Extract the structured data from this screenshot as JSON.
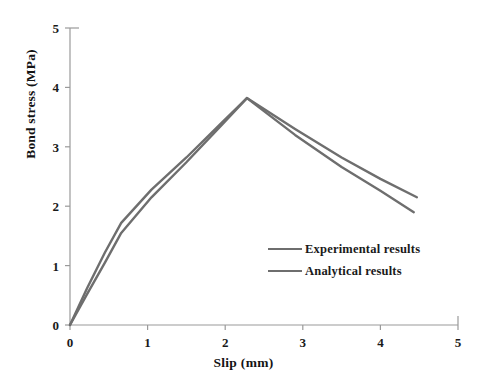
{
  "chart_data": {
    "type": "line",
    "title": "",
    "xlabel": "Slip  (mm)",
    "ylabel": "Bond stress (MPa)",
    "xlim": [
      0,
      5
    ],
    "ylim": [
      0,
      5
    ],
    "xticks": [
      "0",
      "1",
      "2",
      "3",
      "4",
      "5"
    ],
    "yticks": [
      "0",
      "1",
      "2",
      "3",
      "4",
      "5"
    ],
    "grid": false,
    "legend_position": "center-right",
    "series": [
      {
        "name": "Experimental results",
        "color": "#6e6e6e",
        "x": [
          0.0,
          0.22,
          0.45,
          0.66,
          1.05,
          1.5,
          1.95,
          2.28,
          2.9,
          3.5,
          4.0,
          4.47
        ],
        "y": [
          0.0,
          0.62,
          1.22,
          1.72,
          2.28,
          2.82,
          3.4,
          3.82,
          3.3,
          2.82,
          2.46,
          2.15
        ]
      },
      {
        "name": "Analytical results",
        "color": "#6e6e6e",
        "x": [
          0.0,
          0.22,
          0.45,
          0.66,
          1.05,
          1.5,
          1.95,
          2.28,
          2.9,
          3.5,
          4.0,
          4.43
        ],
        "y": [
          0.0,
          0.52,
          1.05,
          1.55,
          2.15,
          2.74,
          3.36,
          3.82,
          3.2,
          2.66,
          2.26,
          1.9
        ]
      }
    ]
  },
  "axes": {
    "x_tick_values": [
      0,
      1,
      2,
      3,
      4,
      5
    ],
    "y_tick_values": [
      0,
      1,
      2,
      3,
      4,
      5
    ],
    "axis_color": "#9a9a9a"
  },
  "legend": {
    "items": [
      {
        "label": "Experimental results"
      },
      {
        "label": "Analytical results"
      }
    ]
  }
}
